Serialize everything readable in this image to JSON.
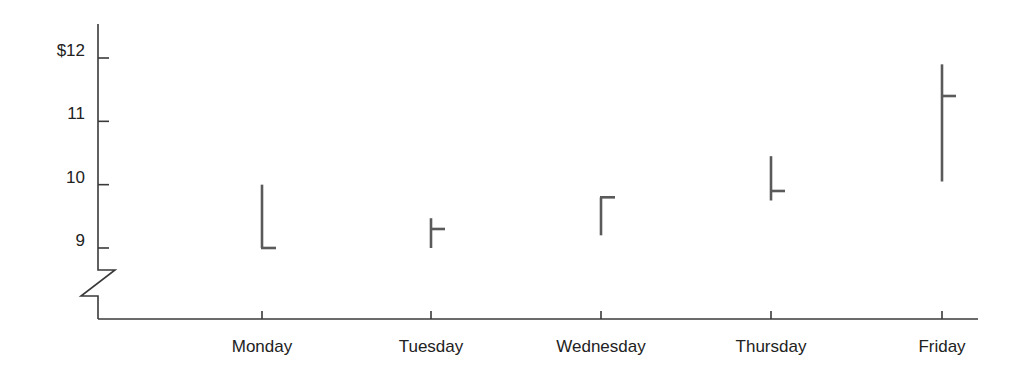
{
  "chart_data": {
    "type": "hlc",
    "title": "",
    "xlabel": "",
    "ylabel": "",
    "categories": [
      "Monday",
      "Tuesday",
      "Wednesday",
      "Thursday",
      "Friday"
    ],
    "series": [
      {
        "name": "Price",
        "high": [
          10.0,
          9.47,
          9.8,
          10.45,
          11.9
        ],
        "low": [
          9.0,
          9.0,
          9.2,
          9.75,
          10.05
        ],
        "close": [
          9.0,
          9.3,
          9.8,
          9.9,
          11.4
        ]
      }
    ],
    "y_ticks": [
      {
        "value": 12,
        "label": "$12"
      },
      {
        "value": 11,
        "label": "11"
      },
      {
        "value": 10,
        "label": "10"
      },
      {
        "value": 9,
        "label": "9"
      }
    ],
    "ylim": [
      8.0,
      12.5
    ],
    "axis_break": true,
    "grid": false,
    "legend": "none"
  }
}
